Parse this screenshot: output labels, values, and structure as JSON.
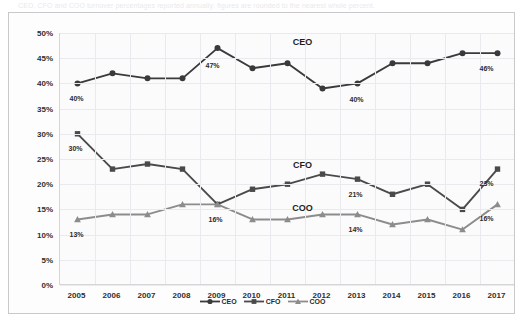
{
  "caption": "CEO, CFO and COO turnover percentages reported annually; figures are rounded to the nearest whole percent.",
  "chart_data": {
    "type": "line",
    "title": "",
    "xlabel": "",
    "ylabel": "",
    "grid": true,
    "legend_position": "bottom",
    "ylim": [
      0,
      50
    ],
    "ytick_labels": [
      "0%",
      "5%",
      "10%",
      "15%",
      "20%",
      "25%",
      "30%",
      "35%",
      "40%",
      "45%",
      "50%"
    ],
    "ytick_values": [
      0,
      5,
      10,
      15,
      20,
      25,
      30,
      35,
      40,
      45,
      50
    ],
    "categories": [
      "2005",
      "2006",
      "2007",
      "2008",
      "2009",
      "2010",
      "2011",
      "2012",
      "2013",
      "2014",
      "2015",
      "2016",
      "2017"
    ],
    "series": [
      {
        "name": "CEO",
        "marker": "circle",
        "color": "#3a3a3a",
        "values": [
          40,
          42,
          41,
          41,
          47,
          43,
          44,
          39,
          40,
          44,
          44,
          46,
          46
        ],
        "inline_label": {
          "text": "CEO",
          "x_pct": 53.5,
          "y_pct": 3.5
        },
        "point_labels": [
          {
            "index": 0,
            "text": "40%",
            "dx": 0,
            "dy": 15
          },
          {
            "index": 4,
            "text": "47%",
            "dx": -4,
            "dy": 17
          },
          {
            "index": 8,
            "text": "40%",
            "dx": 0,
            "dy": 16
          },
          {
            "index": 12,
            "text": "46%",
            "dx": -10,
            "dy": 15
          }
        ]
      },
      {
        "name": "CFO",
        "marker": "square",
        "color": "#4a4a4a",
        "values": [
          30,
          23,
          24,
          23,
          16,
          19,
          20,
          22,
          21,
          18,
          20,
          15,
          23
        ],
        "inline_label": {
          "text": "CFO",
          "x_pct": 53.5,
          "y_pct": 52.5
        },
        "point_labels": [
          {
            "index": 0,
            "text": "30%",
            "dx": -1,
            "dy": 14
          },
          {
            "index": 8,
            "text": "21%",
            "dx": -1,
            "dy": 15
          },
          {
            "index": 12,
            "text": "23%",
            "dx": -10,
            "dy": 14
          }
        ]
      },
      {
        "name": "COO",
        "marker": "triangle",
        "color": "#8c8c8c",
        "values": [
          13,
          14,
          14,
          16,
          16,
          13,
          13,
          14,
          14,
          12,
          13,
          11,
          16
        ],
        "inline_label": {
          "text": "COO",
          "x_pct": 53.5,
          "y_pct": 69.5
        },
        "point_labels": [
          {
            "index": 0,
            "text": "13%",
            "dx": 0,
            "dy": 15
          },
          {
            "index": 4,
            "text": "16%",
            "dx": -1,
            "dy": 15
          },
          {
            "index": 8,
            "text": "14%",
            "dx": -1,
            "dy": 15
          },
          {
            "index": 12,
            "text": "16%",
            "dx": -10,
            "dy": 14
          }
        ]
      }
    ],
    "legend": [
      {
        "label": "CEO",
        "marker": "circle",
        "color": "#3a3a3a"
      },
      {
        "label": "CFO",
        "marker": "square",
        "color": "#4a4a4a"
      },
      {
        "label": "COO",
        "marker": "triangle",
        "color": "#8c8c8c"
      }
    ]
  }
}
